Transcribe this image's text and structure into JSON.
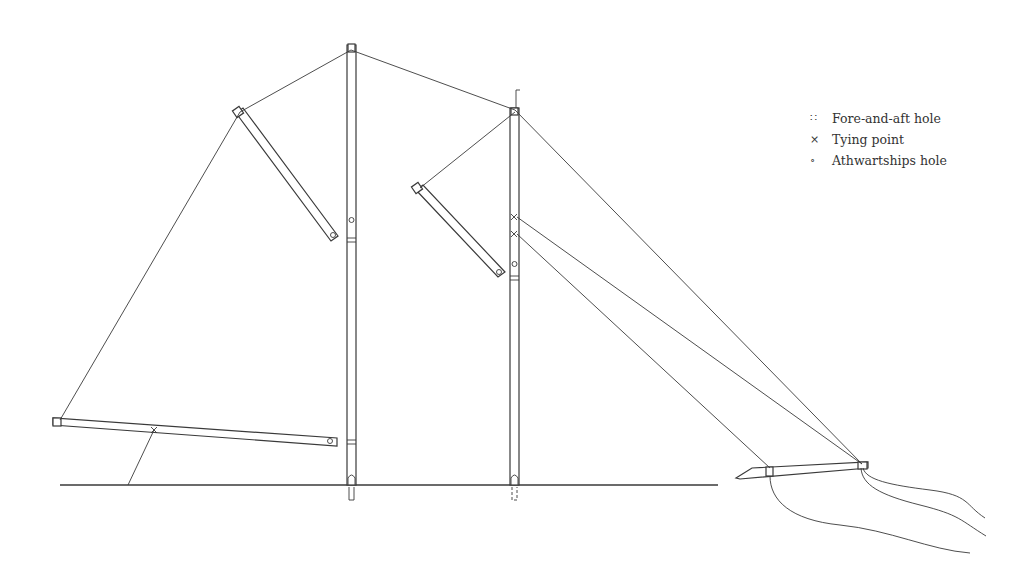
{
  "legend": {
    "items": [
      {
        "symbol": "∷",
        "icon": "fore-and-aft-hole-symbol",
        "label": "Fore-and-aft hole"
      },
      {
        "symbol": "×",
        "icon": "tying-point-symbol",
        "label": "Tying point"
      },
      {
        "symbol": "∘",
        "icon": "athwartships-hole-symbol",
        "label": "Athwartships hole"
      }
    ]
  },
  "colors": {
    "line": "#3a3a3a",
    "background": "#ffffff"
  }
}
